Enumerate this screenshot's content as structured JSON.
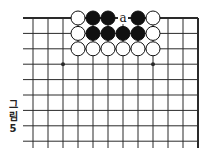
{
  "diagram": {
    "type": "go-board-fragment",
    "caption": {
      "chars": [
        "그",
        "림",
        "5"
      ],
      "text": "그림 5"
    },
    "grid": {
      "columns": 12,
      "rows": 9,
      "origin_x": 33,
      "origin_y": 18,
      "spacing_x": 15,
      "spacing_y": 15.4,
      "line_start_x": 23,
      "line_end_y": 148,
      "top_edge": true,
      "right_edge": true
    },
    "star_points": [
      {
        "col": 2,
        "row": 3
      },
      {
        "col": 8,
        "row": 3
      }
    ],
    "stones": [
      {
        "col": 3,
        "row": 0,
        "color": "white"
      },
      {
        "col": 4,
        "row": 0,
        "color": "black"
      },
      {
        "col": 5,
        "row": 0,
        "color": "black"
      },
      {
        "col": 7,
        "row": 0,
        "color": "black"
      },
      {
        "col": 8,
        "row": 0,
        "color": "white"
      },
      {
        "col": 3,
        "row": 1,
        "color": "white"
      },
      {
        "col": 4,
        "row": 1,
        "color": "black"
      },
      {
        "col": 5,
        "row": 1,
        "color": "black"
      },
      {
        "col": 6,
        "row": 1,
        "color": "black"
      },
      {
        "col": 7,
        "row": 1,
        "color": "black"
      },
      {
        "col": 8,
        "row": 1,
        "color": "white"
      },
      {
        "col": 3,
        "row": 2,
        "color": "white"
      },
      {
        "col": 4,
        "row": 2,
        "color": "white"
      },
      {
        "col": 5,
        "row": 2,
        "color": "white"
      },
      {
        "col": 6,
        "row": 2,
        "color": "white"
      },
      {
        "col": 7,
        "row": 2,
        "color": "white"
      },
      {
        "col": 8,
        "row": 2,
        "color": "white"
      }
    ],
    "labels": [
      {
        "col": 6,
        "row": 0,
        "text": "a"
      }
    ],
    "colors": {
      "line": "#2a2a2a",
      "black_stone": "#111111",
      "white_stone": "#ffffff",
      "stone_outline": "#111111"
    }
  }
}
